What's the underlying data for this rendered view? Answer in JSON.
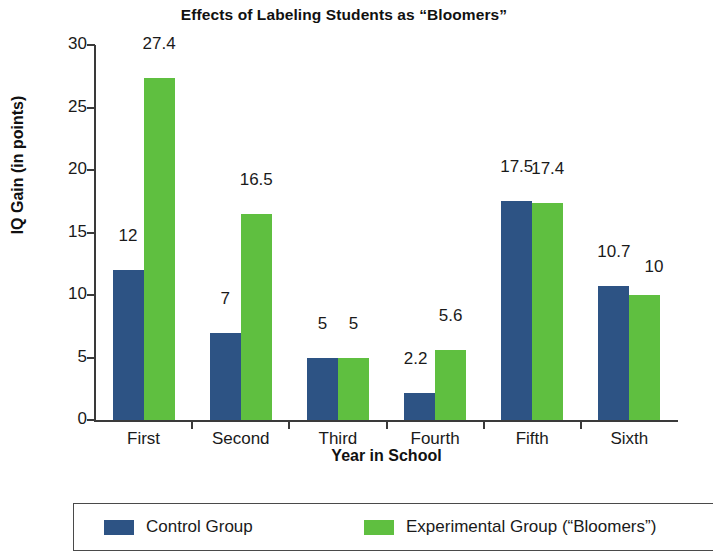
{
  "chart_data": {
    "type": "bar",
    "title": "Effects of Labeling Students as “Bloomers”",
    "xlabel": "Year in School",
    "ylabel": "IQ Gain (in points)",
    "categories": [
      "First",
      "Second",
      "Third",
      "Fourth",
      "Fifth",
      "Sixth"
    ],
    "series": [
      {
        "name": "Control Group",
        "color": "#2d5384",
        "values": [
          12,
          7,
          5,
          2.2,
          17.5,
          10.7
        ],
        "labels": [
          "12",
          "7",
          "5",
          "2.2",
          "17.5",
          "10.7"
        ]
      },
      {
        "name": "Experimental Group (“Bloomers”)",
        "color": "#5fbf40",
        "values": [
          27.4,
          16.5,
          5,
          5.6,
          17.4,
          10
        ],
        "labels": [
          "27.4",
          "16.5",
          "5",
          "5.6",
          "17.4",
          "10"
        ]
      }
    ],
    "ylim": [
      0,
      30
    ],
    "yticks": [
      0,
      5,
      10,
      15,
      20,
      25,
      30
    ],
    "ytick_labels": [
      "0",
      "5",
      "10",
      "15",
      "20",
      "25",
      "30"
    ],
    "grid": false,
    "legend_position": "bottom"
  },
  "legend": {
    "entries": [
      {
        "label": "Control Group",
        "swatch": "control-swatch"
      },
      {
        "label": "Experimental Group (“Bloomers”)",
        "swatch": "experimental-swatch"
      }
    ]
  }
}
